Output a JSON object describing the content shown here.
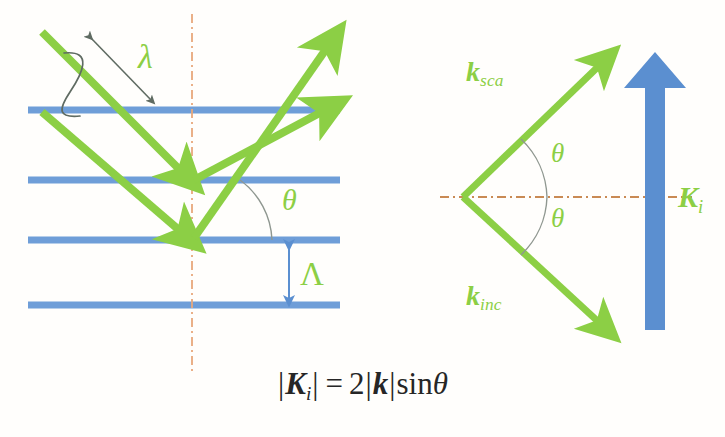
{
  "figure": {
    "background_color": "#fffefc"
  },
  "colors": {
    "green_ray": "#8ccf45",
    "green_label": "#8ccf45",
    "blue_plane": "#6f9ed8",
    "blue_arrow": "#5b8fd0",
    "axis_dashdot": "#e8a87c",
    "annotation_gray": "#5f6b62",
    "equation_text": "#262626"
  },
  "left_panel": {
    "name": "real-space-bragg-planes",
    "planes_label": "lattice planes",
    "plane_count": 4,
    "labels": {
      "wavelength": "λ",
      "angle": "θ",
      "period": "Λ"
    },
    "rays": [
      {
        "name": "incident-ray-upper",
        "kind": "incoming"
      },
      {
        "name": "incident-ray-lower",
        "kind": "incoming"
      },
      {
        "name": "scattered-ray-upper",
        "kind": "outgoing"
      },
      {
        "name": "scattered-ray-lower",
        "kind": "outgoing"
      }
    ],
    "annotations": [
      {
        "name": "wavelength-double-arrow",
        "kind": "double-headed-arrow"
      },
      {
        "name": "wave-period-squiggle",
        "kind": "s-curve"
      },
      {
        "name": "angle-arc",
        "kind": "arc"
      },
      {
        "name": "period-double-arrow",
        "kind": "double-headed-arrow"
      }
    ]
  },
  "right_panel": {
    "name": "k-space-wavevector-triangle",
    "labels": {
      "k_scattered_symbol": "k",
      "k_scattered_sub": "sca",
      "k_incident_symbol": "k",
      "k_incident_sub": "inc",
      "grating_vector_symbol": "K",
      "grating_vector_sub": "i",
      "angle_top": "θ",
      "angle_bottom": "θ"
    },
    "vectors": [
      {
        "name": "k-sca-arrow",
        "label": "k_sca",
        "direction": "up-right"
      },
      {
        "name": "k-inc-arrow",
        "label": "k_inc",
        "direction": "down-right"
      },
      {
        "name": "K-i-arrow",
        "label": "K_i",
        "direction": "up"
      }
    ],
    "annotations": [
      {
        "name": "horizontal-dashdot-axis",
        "kind": "dash-dot-line"
      },
      {
        "name": "angle-arc-top",
        "kind": "arc"
      },
      {
        "name": "angle-arc-bottom",
        "kind": "arc"
      }
    ]
  },
  "equation": {
    "name": "bragg-equation",
    "plain": "|K_i| = 2|k| sinθ",
    "lhs_symbol": "K",
    "lhs_sub": "i",
    "equals": "=",
    "coefficient": "2",
    "rhs_symbol": "k",
    "function": "sin",
    "angle": "θ",
    "bar": "|"
  }
}
